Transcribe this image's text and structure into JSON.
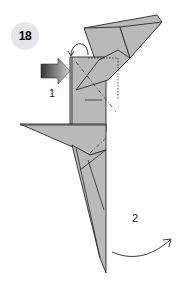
{
  "step": {
    "number": "18"
  },
  "labels": {
    "step1": "1",
    "step2": "2"
  },
  "colors": {
    "paper": "#b9b9b9",
    "stroke": "#2a2a2a",
    "badge": "#e6e6e6",
    "arrow_dark": "#333333",
    "arrow_light": "#cfcfcf"
  },
  "icons": {
    "push_arrow": "push-arrow-icon",
    "flip_arrow": "curved-arrow-icon",
    "swing_arrow": "curved-arrow-icon"
  }
}
